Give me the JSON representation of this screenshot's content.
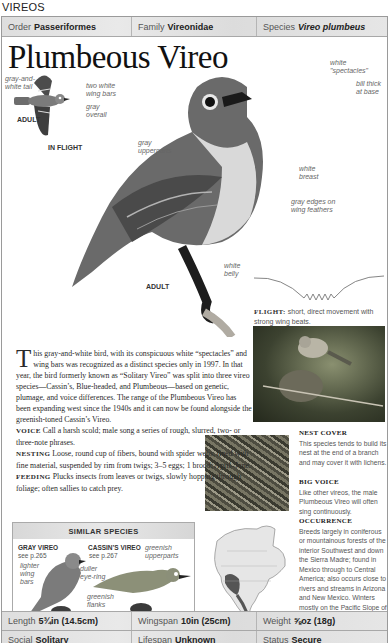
{
  "section_label": "VIREOS",
  "taxonomy": {
    "order_label": "Order",
    "order_value": "Passeriformes",
    "family_label": "Family",
    "family_value": "Vireonidae",
    "species_label": "Species",
    "species_value": "Vireo plumbeus"
  },
  "title": "Plumbeous Vireo",
  "illustration_labels": {
    "gray_white_tail": "gray-and-white tail",
    "two_white_wing_bars": "two white wing bars",
    "gray_overall": "gray overall",
    "flight_adult": "ADULT",
    "in_flight": "IN FLIGHT",
    "gray_upperparts": "gray upperparts",
    "white_spectacles": "white \"spectacles\"",
    "bill_thick": "bill thick at base",
    "white_breast": "white breast",
    "gray_edges": "gray edges on wing feathers",
    "white_belly": "white belly",
    "main_adult": "ADULT"
  },
  "flight": {
    "heading": "FLIGHT:",
    "text": "short, direct movement with strong wing beats."
  },
  "description": {
    "dropcap": "T",
    "intro": "his gray-and-white bird, with its conspicuous white “spectacles” and wing bars was recognized as a distinct species only in 1997. In that year, the bird formerly known as “Solitary Vireo” was split into three vireo species—Cassin’s, Blue-headed, and Plumbeous—based on genetic, plumage, and voice differences. The range of the Plumbeous Vireo has been expanding west since the 1940s and it can now be found alongside the greenish-toned Cassin’s Vireo.",
    "voice_heading": "VOICE",
    "voice_text": "Call a harsh scold; male song a series of rough, slurred, two- or three-note phrases.",
    "nesting_heading": "NESTING",
    "nesting_text": "Loose, round cup of fibers, bound with spider webs, lined with fine material, suspended by rim from twigs; 3–5 eggs; 1 brood; April–June.",
    "feeding_heading": "FEEDING",
    "feeding_text": "Plucks insects from leaves or twigs, slowly hopping through foliage; often sallies to catch prey."
  },
  "sidebar": {
    "nest_cover_heading": "NEST COVER",
    "nest_cover_text": "This species tends to build its nest at the end of a branch and may cover it with lichens.",
    "big_voice_heading": "BIG VOICE",
    "big_voice_text": "Like other vireos, the male Plumbeous Vireo will often sing continuously.",
    "occurrence_heading": "OCCURRENCE",
    "occurrence_text": "Breeds largely in coniferous or mountainous forests of the interior Southwest and down the Sierra Madre; found in Mexico through to Central America; also occurs close to rivers and streams in Arizona and New Mexico. Winters mostly on the Pacific Slope of Mexico."
  },
  "similar_species": {
    "heading": "SIMILAR SPECIES",
    "species": [
      {
        "name": "GRAY VIREO",
        "see": "see p.265",
        "note": "lighter wing bars"
      },
      {
        "name": "CASSIN’S VIREO",
        "see": "see p.267",
        "note_1": "duller eye-ring",
        "note_2": "greenish upperparts",
        "note_3": "greenish flanks"
      }
    ]
  },
  "stats": {
    "length_label": "Length",
    "length_value": "5¾in (14.5cm)",
    "wingspan_label": "Wingspan",
    "wingspan_value": "10in (25cm)",
    "weight_label": "Weight",
    "weight_value": "⅝oz (18g)",
    "social_label": "Social",
    "social_value": "Solitary",
    "lifespan_label": "Lifespan",
    "lifespan_value": "Unknown",
    "status_label": "Status",
    "status_value": "Secure"
  }
}
